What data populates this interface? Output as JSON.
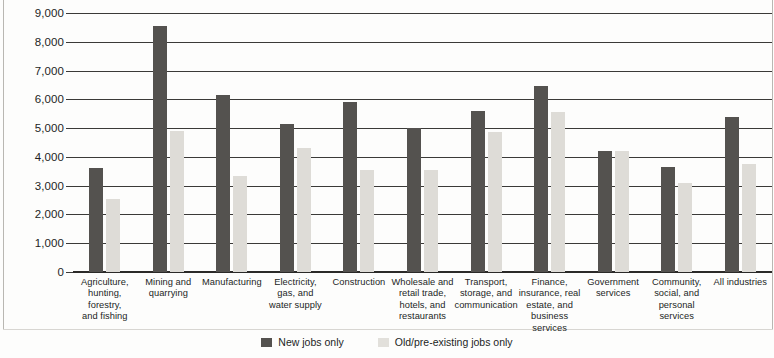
{
  "chart_data": {
    "type": "bar",
    "title": "",
    "xlabel": "",
    "ylabel": "",
    "ylim": [
      0,
      9000
    ],
    "yticks": [
      0,
      1000,
      2000,
      3000,
      4000,
      5000,
      6000,
      7000,
      8000,
      9000
    ],
    "ytick_labels": [
      "0",
      "1,000",
      "2,000",
      "3,000",
      "4,000",
      "5,000",
      "6,000",
      "7,000",
      "8,000",
      "9,000"
    ],
    "grid": true,
    "legend_position": "bottom",
    "categories": [
      "Agriculture, hunting, forestry, and fishing",
      "Mining and quarrying",
      "Manufacturing",
      "Electricity, gas, and water supply",
      "Construction",
      "Wholesale and retail trade, hotels, and restaurants",
      "Transport, storage, and communication",
      "Finance, insurance, real estate, and business services",
      "Government services",
      "Community, social, and personal services",
      "All industries"
    ],
    "category_lines": [
      [
        "Agriculture,",
        "hunting, forestry,",
        "and fishing"
      ],
      [
        "Mining and",
        "quarrying"
      ],
      [
        "Manufacturing"
      ],
      [
        "Electricity,",
        "gas, and",
        "water supply"
      ],
      [
        "Construction"
      ],
      [
        "Wholesale and",
        "retail trade,",
        "hotels, and",
        "restaurants"
      ],
      [
        "Transport,",
        "storage, and",
        "communication"
      ],
      [
        "Finance,",
        "insurance, real",
        "estate, and",
        "business services"
      ],
      [
        "Government",
        "services"
      ],
      [
        "Community,",
        "social, and",
        "personal services"
      ],
      [
        "All industries"
      ]
    ],
    "series": [
      {
        "name": "New jobs only",
        "color": "#54524f",
        "values": [
          3600,
          8550,
          6150,
          5150,
          5900,
          5000,
          5600,
          6450,
          4200,
          3650,
          5400
        ]
      },
      {
        "name": "Old/pre-existing jobs only",
        "color": "#dedcd7",
        "values": [
          2550,
          4900,
          3350,
          4300,
          3550,
          3550,
          4850,
          5550,
          4200,
          3100,
          3750
        ]
      }
    ]
  },
  "legend": {
    "items": [
      {
        "label": "New jobs only",
        "color": "#54524f"
      },
      {
        "label": "Old/pre-existing jobs only",
        "color": "#e2e0db"
      }
    ]
  }
}
